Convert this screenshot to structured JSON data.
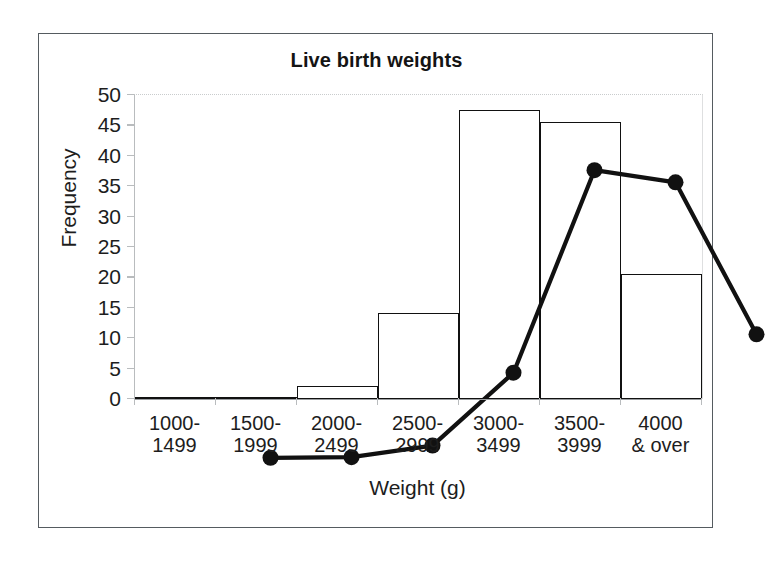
{
  "figure": {
    "title": "Live birth weights"
  },
  "chart_data": {
    "type": "bar",
    "title": "Live birth weights",
    "xlabel": "Weight (g)",
    "ylabel": "Frequency",
    "categories": [
      "1000-1499",
      "1500-1999",
      "2000-2499",
      "2500-2999",
      "3000-3499",
      "3500-3999",
      "4000 & over"
    ],
    "category_lines": [
      [
        "1000-",
        "1499"
      ],
      [
        "1500-",
        "1999"
      ],
      [
        "2000-",
        "2499"
      ],
      [
        "2500-",
        "2999"
      ],
      [
        "3000-",
        "3499"
      ],
      [
        "3500-",
        "3999"
      ],
      [
        "4000",
        "& over"
      ]
    ],
    "values": [
      0.2,
      0.3,
      2.2,
      14.2,
      47.5,
      45.5,
      20.5
    ],
    "series": [
      {
        "name": "Histogram",
        "type": "bar",
        "values": [
          0.2,
          0.3,
          2.2,
          14.2,
          47.5,
          45.5,
          20.5
        ]
      },
      {
        "name": "Frequency polygon",
        "type": "line",
        "marker": "filled-circle",
        "values": [
          0.2,
          0.3,
          2.2,
          14.2,
          47.5,
          45.5,
          20.5
        ]
      }
    ],
    "ylim": [
      0,
      50
    ],
    "yticks": [
      0,
      5,
      10,
      15,
      20,
      25,
      30,
      35,
      40,
      45,
      50
    ],
    "ytick_labels": [
      "0",
      "5",
      "10",
      "15",
      "20",
      "25",
      "30",
      "35",
      "40",
      "45",
      "50"
    ],
    "grid": false,
    "legend": "none",
    "colors": {
      "bar_fill": "#ffffff",
      "bar_edge": "#111111",
      "line": "#111111",
      "marker": "#111111",
      "axis": "#b9bcbe",
      "text": "#1d1d1d"
    }
  }
}
